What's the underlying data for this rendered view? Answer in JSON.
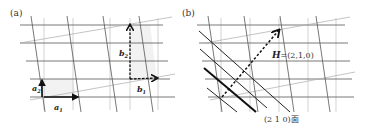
{
  "figure": {
    "panel_a": {
      "label": "(a)",
      "vectors": {
        "a1": "a",
        "a1_sub": "1",
        "a2": "a",
        "a2_sub": "2",
        "b1": "b",
        "b1_sub": "1",
        "b2": "b",
        "b2_sub": "2"
      }
    },
    "panel_b": {
      "label": "(b)",
      "vector_H": "H",
      "vector_H_value": "=(2,1,0)",
      "plane_label": "(2 1 0)面"
    },
    "colors": {
      "lattice_line": "#666666",
      "light_line": "#bbbbbb",
      "bold": "#111111",
      "shade": "#f2f2f2"
    }
  }
}
